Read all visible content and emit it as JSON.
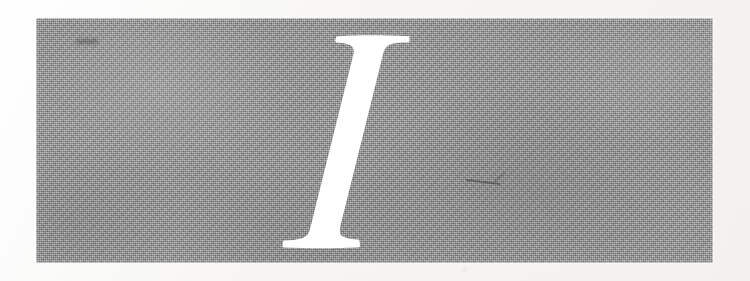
{
  "page": {
    "type": "part-divider",
    "width": 750,
    "height": 281,
    "paper_color": "#f7f6f4"
  },
  "panel": {
    "name": "gray-halftone-panel",
    "fill_color": "#9e9e9e",
    "x": 36,
    "y": 18,
    "width": 677,
    "height": 245,
    "texture": "halftone-dither-grain"
  },
  "numeral": {
    "value": "I",
    "roman_numeral": "I",
    "arabic_value": 1,
    "label": "Part I",
    "style": "italic-serif-capital",
    "color": "#ffffff",
    "knockout": true
  },
  "artifacts": [
    {
      "name": "smudge-upper-left",
      "kind": "ink-smudge"
    },
    {
      "name": "scratch-mid-right",
      "kind": "hairline-scratch"
    }
  ]
}
